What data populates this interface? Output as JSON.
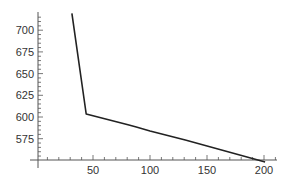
{
  "chart_data": {
    "type": "line",
    "title": "",
    "xlabel": "",
    "ylabel": "",
    "xlim": [
      0,
      210
    ],
    "ylim": [
      551,
      719
    ],
    "x_ticks": [
      50,
      100,
      150,
      200
    ],
    "y_ticks": [
      575,
      600,
      625,
      650,
      675,
      700
    ],
    "grid": false,
    "legend": null,
    "series": [
      {
        "name": "series-1",
        "color": "#222222",
        "x": [
          31.5,
          44,
          80.7,
          88,
          100,
          131,
          201
        ],
        "y": [
          719.5,
          603.5,
          591,
          588.5,
          584,
          573.5,
          548
        ]
      }
    ]
  },
  "axis": {
    "x_tick_labels": [
      "50",
      "100",
      "150",
      "200"
    ],
    "y_tick_labels": [
      "575",
      "600",
      "625",
      "650",
      "675",
      "700"
    ]
  }
}
